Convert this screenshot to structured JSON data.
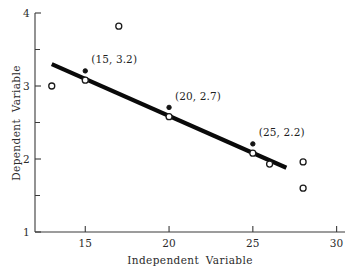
{
  "chart_data": {
    "type": "scatter",
    "title": "",
    "xlabel": "Independent  Variable",
    "ylabel": "Dependent  Variable",
    "xlim": [
      12.0,
      30.5
    ],
    "ylim": [
      1.0,
      4.0
    ],
    "grid": false,
    "legend": "none",
    "x_ticks": [
      "15",
      "20",
      "25",
      "30"
    ],
    "x_tick_values": [
      15,
      20,
      25,
      30
    ],
    "y_ticks": [
      "1",
      "2",
      "3",
      "4"
    ],
    "y_tick_values": [
      1,
      2,
      3,
      4
    ],
    "y_minor_tick_values": [
      1.5,
      2.5,
      3.5
    ],
    "series": [
      {
        "name": "observations",
        "marker": "open-circle",
        "color": "#1a1a1a",
        "points": [
          {
            "x": 13.0,
            "y": 3.0
          },
          {
            "x": 15.0,
            "y": 3.08
          },
          {
            "x": 17.0,
            "y": 3.82
          },
          {
            "x": 20.0,
            "y": 2.58
          },
          {
            "x": 25.0,
            "y": 2.08
          },
          {
            "x": 26.0,
            "y": 1.93
          },
          {
            "x": 28.0,
            "y": 1.96
          },
          {
            "x": 28.0,
            "y": 1.6
          }
        ]
      },
      {
        "name": "regression-line",
        "type": "line",
        "color": "#0a0a0a",
        "x_start": 13.0,
        "y_start": 3.3,
        "x_end": 27.0,
        "y_end": 1.88
      }
    ],
    "fit_markers": [
      {
        "x": 15,
        "y": 3.2
      },
      {
        "x": 20,
        "y": 2.7
      },
      {
        "x": 25,
        "y": 2.2
      }
    ],
    "annotations": [
      {
        "label": "(15, 3.2)",
        "x": 15,
        "y": 3.2
      },
      {
        "label": "(20, 2.7)",
        "x": 20,
        "y": 2.7
      },
      {
        "label": "(25, 2.2)",
        "x": 25,
        "y": 2.2
      }
    ]
  }
}
